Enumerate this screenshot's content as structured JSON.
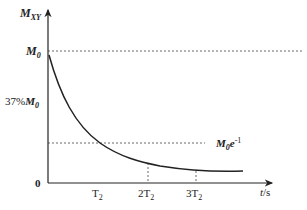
{
  "diagram": {
    "y_axis": {
      "label_main": "M",
      "label_sub": "XY"
    },
    "x_axis": {
      "label_var": "t",
      "label_unit": "/s"
    },
    "origin_label": "0",
    "levels": {
      "m0": {
        "main": "M",
        "sub": "0"
      },
      "pct37": {
        "prefix": "37%",
        "main": "M",
        "sub": "0"
      },
      "m0e": {
        "main": "M",
        "sub": "0",
        "base": "e",
        "exp": "-1"
      }
    },
    "ticks": [
      {
        "pre": "",
        "main": "T",
        "sub": "2"
      },
      {
        "pre": "2",
        "main": "T",
        "sub": "2"
      },
      {
        "pre": "3",
        "main": "T",
        "sub": "2"
      }
    ],
    "colors": {
      "line": "#222222",
      "dashed": "#444444"
    }
  }
}
